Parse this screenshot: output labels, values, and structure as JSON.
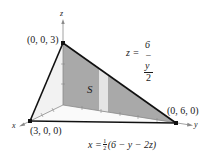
{
  "diagram": {
    "axes": {
      "x_label": "x",
      "y_label": "y",
      "z_label": "z"
    },
    "vertices": [
      {
        "label": "(0, 0, 3)"
      },
      {
        "label": "(3, 0, 0)"
      },
      {
        "label": "(0, 6, 0)"
      }
    ],
    "surface_label": "S",
    "equation_z": {
      "lhs": "z =",
      "numerator": "6 − y",
      "denominator": "2"
    },
    "equation_x": {
      "lhs": "x =",
      "frac_num": "1",
      "frac_den": "2",
      "rhs": "(6 − y − 2z)"
    },
    "colors": {
      "shaded_plane": "#a9a9a9",
      "light_strip": "#e4e4e4",
      "back_wall": "#f0f0f0",
      "edge": "#111111",
      "axis": "#8a8a8a"
    }
  }
}
